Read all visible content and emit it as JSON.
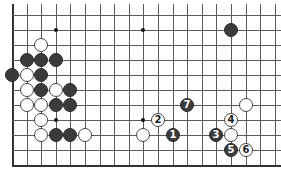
{
  "diagram": {
    "type": "go-board-fragment",
    "grid": {
      "columns": 19,
      "rows": 11,
      "left_edge": true,
      "bottom_edge": true,
      "top_edge": false,
      "right_edge": false,
      "origin_x": 12,
      "origin_y": 15,
      "col_spacing": 14.6,
      "row_spacing": 15
    },
    "colors": {
      "line": "#5a5a5a",
      "black_stone": "#3b3b3b",
      "white_stone": "#ffffff",
      "stone_outline": "#444444"
    },
    "star_points": [
      {
        "col": 3,
        "row": 1
      },
      {
        "col": 9,
        "row": 1
      },
      {
        "col": 3,
        "row": 7
      },
      {
        "col": 9,
        "row": 7
      }
    ],
    "stones": [
      {
        "color": "white",
        "col": 2,
        "row": 2,
        "label": ""
      },
      {
        "color": "black",
        "col": 1,
        "row": 3,
        "label": ""
      },
      {
        "color": "black",
        "col": 2,
        "row": 3,
        "label": ""
      },
      {
        "color": "black",
        "col": 3,
        "row": 3,
        "label": ""
      },
      {
        "color": "black",
        "col": 0,
        "row": 4,
        "label": ""
      },
      {
        "color": "white",
        "col": 1,
        "row": 4,
        "label": ""
      },
      {
        "color": "black",
        "col": 2,
        "row": 4,
        "label": ""
      },
      {
        "color": "white",
        "col": 1,
        "row": 5,
        "label": ""
      },
      {
        "color": "black",
        "col": 2,
        "row": 5,
        "label": ""
      },
      {
        "color": "white",
        "col": 3,
        "row": 5,
        "label": ""
      },
      {
        "color": "black",
        "col": 4,
        "row": 5,
        "label": ""
      },
      {
        "color": "white",
        "col": 1,
        "row": 6,
        "label": ""
      },
      {
        "color": "white",
        "col": 2,
        "row": 6,
        "label": ""
      },
      {
        "color": "black",
        "col": 3,
        "row": 6,
        "label": ""
      },
      {
        "color": "black",
        "col": 4,
        "row": 6,
        "label": ""
      },
      {
        "color": "white",
        "col": 2,
        "row": 7,
        "label": ""
      },
      {
        "color": "white",
        "col": 2,
        "row": 8,
        "label": ""
      },
      {
        "color": "black",
        "col": 3,
        "row": 8,
        "label": ""
      },
      {
        "color": "black",
        "col": 4,
        "row": 8,
        "label": ""
      },
      {
        "color": "white",
        "col": 5,
        "row": 8,
        "label": ""
      },
      {
        "color": "black",
        "col": 15,
        "row": 1,
        "label": ""
      },
      {
        "color": "black",
        "col": 12,
        "row": 6,
        "label": "7"
      },
      {
        "color": "white",
        "col": 16,
        "row": 6,
        "label": ""
      },
      {
        "color": "white",
        "col": 10,
        "row": 7,
        "label": "2"
      },
      {
        "color": "white",
        "col": 15,
        "row": 7,
        "label": "4"
      },
      {
        "color": "white",
        "col": 9,
        "row": 8,
        "label": ""
      },
      {
        "color": "black",
        "col": 11,
        "row": 8,
        "label": "1"
      },
      {
        "color": "black",
        "col": 14,
        "row": 8,
        "label": "3"
      },
      {
        "color": "white",
        "col": 15,
        "row": 8,
        "label": ""
      },
      {
        "color": "black",
        "col": 15,
        "row": 9,
        "label": "5"
      },
      {
        "color": "white",
        "col": 16,
        "row": 9,
        "label": "6"
      }
    ]
  }
}
